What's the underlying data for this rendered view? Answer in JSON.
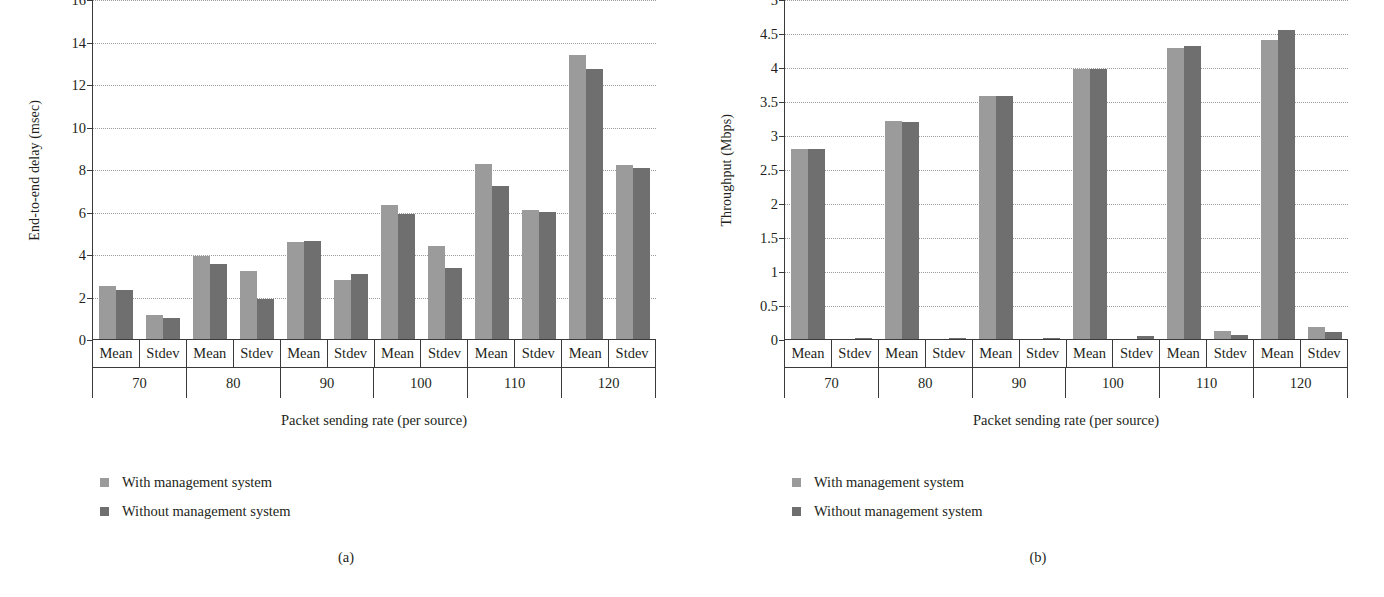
{
  "figure": {
    "panels": [
      {
        "caption": "(a)",
        "ylabel": "End-to-end delay (msec)",
        "xlabel": "Packet sending rate (per source)",
        "legend": [
          {
            "label": "With management system",
            "swatch": "light",
            "color": "#9b9b9b"
          },
          {
            "label": "Without management system",
            "swatch": "dark",
            "color": "#6f6f6f"
          }
        ],
        "chart_data": {
          "type": "bar",
          "title": "",
          "xlabel": "Packet sending rate (per source)",
          "ylabel": "End-to-end delay (msec)",
          "ylim": [
            0,
            16
          ],
          "yticks": [
            0,
            2,
            4,
            6,
            8,
            10,
            12,
            14,
            16
          ],
          "ytick_labels": [
            "0",
            "2",
            "4",
            "6",
            "8",
            "10",
            "12",
            "14",
            "16"
          ],
          "grid": "horizontal-dotted",
          "legend_position": "below-left",
          "groups": [
            "70",
            "80",
            "90",
            "100",
            "110",
            "120"
          ],
          "subcategories": [
            "Mean",
            "Stdev"
          ],
          "series": [
            {
              "name": "With management system",
              "color": "#9b9b9b",
              "mean": [
                2.5,
                3.9,
                4.55,
                6.3,
                8.25,
                13.35
              ],
              "stdev": [
                1.15,
                3.2,
                2.8,
                4.4,
                6.05,
                8.2
              ]
            },
            {
              "name": "Without management system",
              "color": "#6f6f6f",
              "mean": [
                2.3,
                3.55,
                4.6,
                5.9,
                7.2,
                12.7
              ],
              "stdev": [
                1.0,
                1.9,
                3.05,
                3.35,
                6.0,
                8.05
              ]
            }
          ]
        }
      },
      {
        "caption": "(b)",
        "ylabel": "Throughput (Mbps)",
        "xlabel": "Packet sending rate (per source)",
        "legend": [
          {
            "label": "With management system",
            "swatch": "light",
            "color": "#9b9b9b"
          },
          {
            "label": "Without management system",
            "swatch": "dark",
            "color": "#6f6f6f"
          }
        ],
        "chart_data": {
          "type": "bar",
          "title": "",
          "xlabel": "Packet sending rate (per source)",
          "ylabel": "Throughput (Mbps)",
          "ylim": [
            0,
            5
          ],
          "yticks": [
            0,
            0.5,
            1,
            1.5,
            2,
            2.5,
            3,
            3.5,
            4,
            4.5,
            5
          ],
          "ytick_labels": [
            "0",
            "0.5",
            "1",
            "1.5",
            "2",
            "2.5",
            "3",
            "3.5",
            "4",
            "4.5",
            "5"
          ],
          "grid": "horizontal-dotted",
          "legend_position": "below-left",
          "groups": [
            "70",
            "80",
            "90",
            "100",
            "110",
            "120"
          ],
          "subcategories": [
            "Mean",
            "Stdev"
          ],
          "series": [
            {
              "name": "With management system",
              "color": "#9b9b9b",
              "mean": [
                2.8,
                3.2,
                3.58,
                3.97,
                4.28,
                4.4
              ],
              "stdev": [
                0.0,
                0.0,
                0.0,
                0.0,
                0.12,
                0.17
              ]
            },
            {
              "name": "Without management system",
              "color": "#6f6f6f",
              "mean": [
                2.8,
                3.19,
                3.58,
                3.97,
                4.31,
                4.55
              ],
              "stdev": [
                0.02,
                0.02,
                0.02,
                0.04,
                0.06,
                0.11
              ]
            }
          ]
        }
      }
    ]
  }
}
